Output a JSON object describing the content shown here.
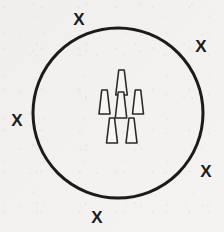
{
  "figure": {
    "background_color": "#f4f3f1",
    "ink_color": "#1b1b1b",
    "canvas": {
      "width": 224,
      "height": 232
    },
    "boundary": {
      "shape": "circle",
      "center_x": 118,
      "center_y": 113,
      "radius": 85,
      "stroke_width": 3,
      "stroke_color": "#1b1b1b",
      "fill": "none"
    },
    "cones": {
      "count": 6,
      "label": "cone-marker",
      "stroke_width": 1.6,
      "stroke_color": "#2a2a2a",
      "fill": "#f7f6f4",
      "arrangement": "triangular cluster: 1 top, 3 middle, 2 bottom",
      "items": [
        {
          "id": "cone-top",
          "row": "top",
          "cx": 121.5,
          "apex_y": 70,
          "base_y": 95,
          "top_width": 5.5,
          "base_width": 11.5
        },
        {
          "id": "cone-middle-left",
          "row": "middle",
          "cx": 104.5,
          "apex_y": 90,
          "base_y": 114,
          "top_width": 5.5,
          "base_width": 11.0
        },
        {
          "id": "cone-middle-center",
          "row": "middle",
          "cx": 121.0,
          "apex_y": 92,
          "base_y": 118,
          "top_width": 5.5,
          "base_width": 11.5
        },
        {
          "id": "cone-middle-right",
          "row": "middle",
          "cx": 138.0,
          "apex_y": 90,
          "base_y": 114,
          "top_width": 5.5,
          "base_width": 11.0
        },
        {
          "id": "cone-bottom-left",
          "row": "bottom",
          "cx": 112.0,
          "apex_y": 118,
          "base_y": 143,
          "top_width": 5.0,
          "base_width": 11.0
        },
        {
          "id": "cone-bottom-right",
          "row": "bottom",
          "cx": 131.5,
          "apex_y": 118,
          "base_y": 143,
          "top_width": 5.0,
          "base_width": 11.0
        }
      ]
    },
    "x_marks": {
      "count": 5,
      "glyph": "X",
      "label": "x-mark",
      "color": "#1b1b1b",
      "items": [
        {
          "id": "x-top",
          "text": "X",
          "x": 79,
          "y": 19,
          "position": "top, outside circle"
        },
        {
          "id": "x-top-right",
          "text": "X",
          "x": 201,
          "y": 46,
          "position": "upper right, outside circle"
        },
        {
          "id": "x-left",
          "text": "X",
          "x": 17,
          "y": 120,
          "position": "left, outside circle"
        },
        {
          "id": "x-bottom-right",
          "text": "X",
          "x": 206,
          "y": 171,
          "position": "lower right, outside circle"
        },
        {
          "id": "x-bottom",
          "text": "X",
          "x": 97,
          "y": 217,
          "position": "bottom, outside circle"
        }
      ]
    }
  }
}
